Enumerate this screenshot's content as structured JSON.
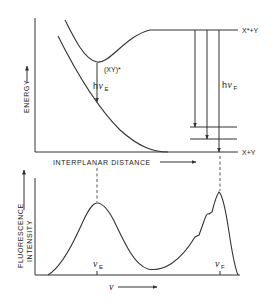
{
  "top_panel": {
    "y_axis_label": "ENERGY",
    "x_axis_label": "INTERPLANAR DISTANCE",
    "excimer_label": "(XY)*",
    "excited_asymptote_label": "X*+Y",
    "ground_asymptote_label": "X+Y",
    "excimer_transition": {
      "h": "h",
      "nu": "ν",
      "sub": "E"
    },
    "fluorescence_transition": {
      "h": "h",
      "nu": "ν",
      "sub": "F"
    }
  },
  "bottom_panel": {
    "y_axis_label_line1": "FLUORESCENCE",
    "y_axis_label_line2": "INTENSITY",
    "x_axis_label": "ν",
    "peak_E": {
      "nu": "ν",
      "sub": "E"
    },
    "peak_F": {
      "nu": "ν",
      "sub": "F"
    }
  },
  "colors": {
    "ink": "#333333",
    "background": "#ffffff"
  }
}
